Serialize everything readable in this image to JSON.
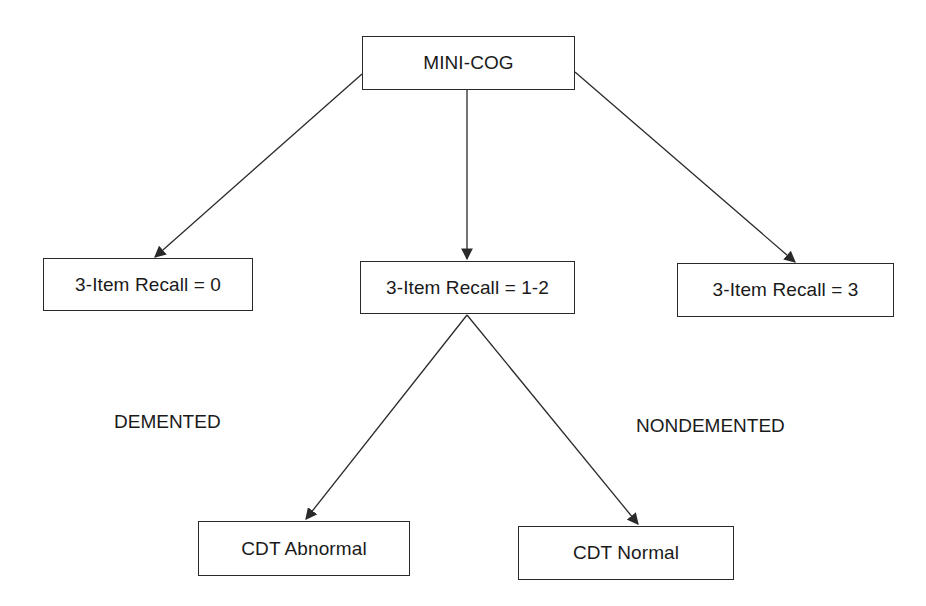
{
  "diagram": {
    "root": {
      "label": "MINI-COG"
    },
    "recall_nodes": [
      {
        "label": "3-Item Recall = 0"
      },
      {
        "label": "3-Item Recall = 1-2"
      },
      {
        "label": "3-Item Recall = 3"
      }
    ],
    "cdt_nodes": [
      {
        "label": "CDT Abnormal"
      },
      {
        "label": "CDT Normal"
      }
    ],
    "outcome_labels": {
      "demented": "DEMENTED",
      "nondemented": "NONDEMENTED"
    },
    "edges": [
      {
        "from": "MINI-COG",
        "to": "3-Item Recall = 0"
      },
      {
        "from": "MINI-COG",
        "to": "3-Item Recall = 1-2"
      },
      {
        "from": "MINI-COG",
        "to": "3-Item Recall = 3"
      },
      {
        "from": "3-Item Recall = 1-2",
        "to": "CDT Abnormal"
      },
      {
        "from": "3-Item Recall = 1-2",
        "to": "CDT Normal"
      }
    ],
    "colors": {
      "line": "#2a2a2a",
      "background": "#ffffff",
      "text": "#1a1a1a"
    }
  }
}
